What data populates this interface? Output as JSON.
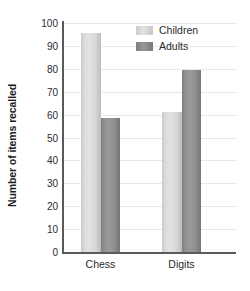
{
  "chart_data": {
    "type": "bar",
    "title": "",
    "xlabel": "",
    "ylabel": "Number of items recalled",
    "categories": [
      "Chess",
      "Digits"
    ],
    "series": [
      {
        "name": "Children",
        "values": [
          95.5,
          61
        ],
        "color": "#dcdcdc"
      },
      {
        "name": "Adults",
        "values": [
          58.5,
          79.5
        ],
        "color": "#8e8e8e"
      }
    ],
    "ylim": [
      0,
      100
    ],
    "ytick_labels": [
      "100",
      "90",
      "80",
      "70",
      "60",
      "50",
      "40",
      "30",
      "20",
      "10",
      "0"
    ],
    "ytick_values": [
      100,
      90,
      80,
      70,
      60,
      50,
      40,
      30,
      20,
      10,
      0
    ],
    "grid": true,
    "legend_position": "top-right",
    "axis_color": "#5a5a5a",
    "grid_color": "#e8e8e8"
  },
  "legend": {
    "entries": [
      {
        "label": "Children"
      },
      {
        "label": "Adults"
      }
    ]
  }
}
